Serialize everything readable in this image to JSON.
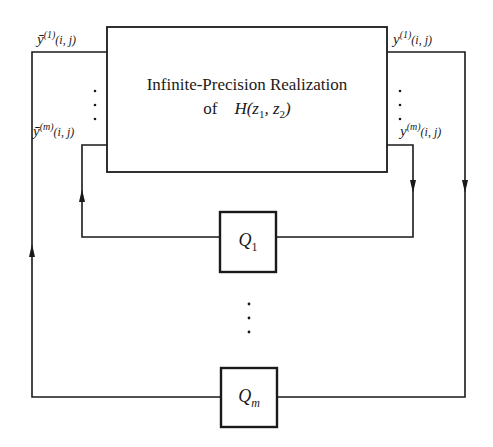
{
  "diagram": {
    "main_block": {
      "line1": "Infinite-Precision Realization",
      "line2_prefix": "of",
      "line2_func": "H",
      "line2_args": "(z",
      "line2_sub1": "1",
      "line2_mid": ", z",
      "line2_sub2": "2",
      "line2_close": ")"
    },
    "signals": {
      "left_top": {
        "base": "ȳ",
        "sup": "(1)",
        "args": "(i, j)"
      },
      "left_bottom": {
        "base": "ȳ",
        "sup": "(m)",
        "args": "(i, j)"
      },
      "right_top": {
        "base": "y",
        "sup": "(1)",
        "args": "(i, j)"
      },
      "right_bottom": {
        "base": "y",
        "sup": "(m)",
        "args": "(i, j)"
      }
    },
    "quantizers": [
      {
        "base": "Q",
        "sub": "1"
      },
      {
        "base": "Q",
        "sub": "m"
      }
    ],
    "ellipsis": "⋮",
    "colors": {
      "line": "#1a1a1a",
      "background": "#ffffff"
    }
  }
}
